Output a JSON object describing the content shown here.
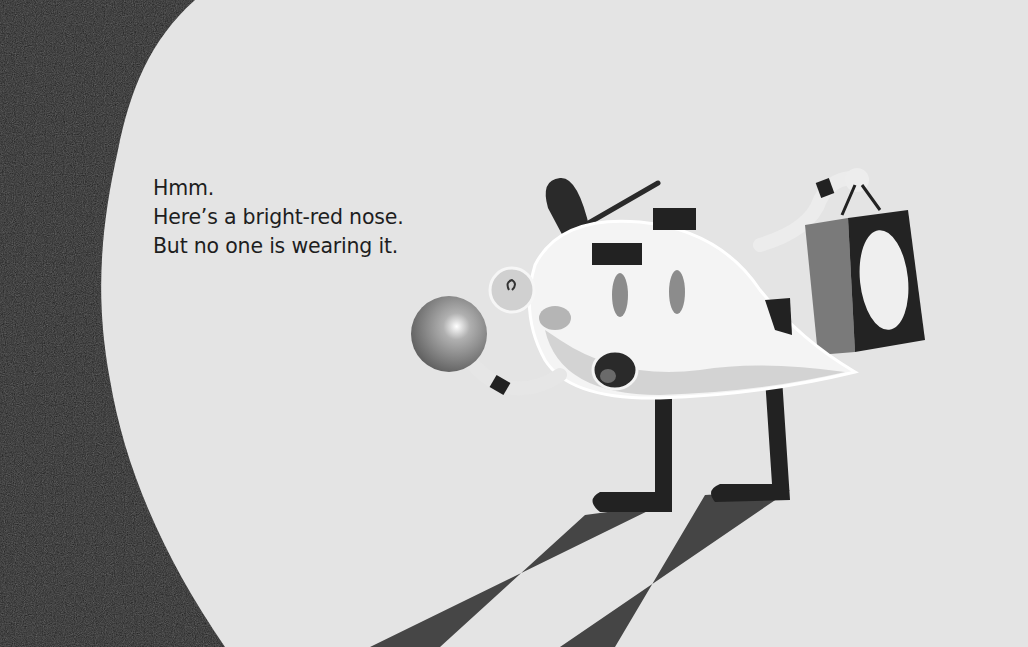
{
  "page": {
    "text_lines": [
      "Hmm.",
      "Here’s a bright-red nose.",
      "But no one is wearing it."
    ]
  },
  "illustration": {
    "subject": "teardrop-shaped character with cap holding a red nose and a shopping bag under a spotlight",
    "colors": {
      "background": "#e4e4e4",
      "shadow": "#1c1c1c",
      "body": "#f2f2f2",
      "nose": "#8a8a8a",
      "bag": "#7a7a7a"
    }
  }
}
